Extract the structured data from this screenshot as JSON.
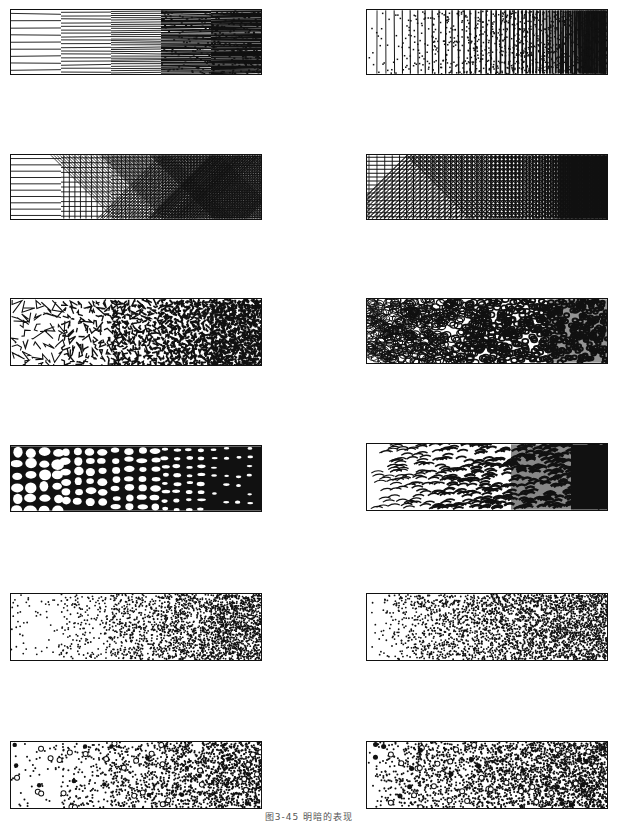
{
  "figure": {
    "caption": "图3-45  明暗的表现",
    "ink_color": "#111111",
    "paper_color": "#ffffff"
  },
  "panels": [
    {
      "id": "row1-left",
      "technique": "horizontal-lines-stepped",
      "style": "stepped",
      "steps": 5
    },
    {
      "id": "row1-right",
      "technique": "vertical-lines-continuous",
      "style": "continuous"
    },
    {
      "id": "row2-left",
      "technique": "cross-hatch-stepped",
      "style": "stepped",
      "steps": 5
    },
    {
      "id": "row2-right",
      "technique": "cross-hatch-continuous",
      "style": "continuous"
    },
    {
      "id": "row3-left",
      "technique": "angular-cells-stepped",
      "style": "stepped",
      "steps": 5
    },
    {
      "id": "row3-right",
      "technique": "round-cells-continuous",
      "style": "continuous"
    },
    {
      "id": "row4-left",
      "technique": "pebble-stones-stepped",
      "style": "stepped",
      "steps": 5
    },
    {
      "id": "row4-right",
      "technique": "scale-strokes-continuous",
      "style": "continuous"
    },
    {
      "id": "row5-left",
      "technique": "stipple-dots-stepped",
      "style": "stepped",
      "steps": 5
    },
    {
      "id": "row5-right",
      "technique": "stipple-dots-continuous",
      "style": "continuous"
    },
    {
      "id": "row6-left",
      "technique": "dots-and-circles-stepped",
      "style": "stepped",
      "steps": 5
    },
    {
      "id": "row6-right",
      "technique": "dots-and-circles-continuous",
      "style": "continuous"
    }
  ]
}
